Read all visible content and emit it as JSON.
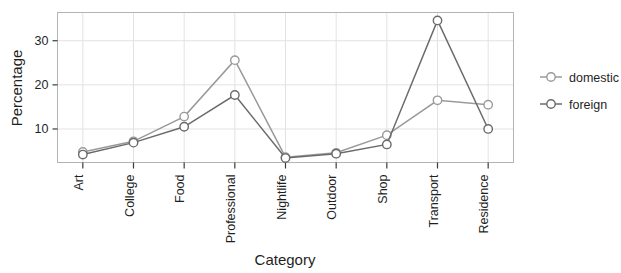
{
  "chart_data": {
    "type": "line",
    "title": "",
    "xlabel": "Category",
    "ylabel": "Percentage",
    "categories": [
      "Art",
      "College",
      "Food",
      "Professional",
      "Nightlife",
      "Outdoor",
      "Shop",
      "Transport",
      "Residence"
    ],
    "series": [
      {
        "name": "domestic",
        "color": "#9a9a9a",
        "marker": "circle-open",
        "values": [
          4.8,
          7.2,
          12.8,
          25.6,
          3.6,
          4.6,
          8.6,
          16.5,
          15.5
        ]
      },
      {
        "name": "foreign",
        "color": "#6b6b6b",
        "marker": "circle-open",
        "values": [
          4.2,
          6.9,
          10.5,
          17.7,
          3.4,
          4.4,
          6.5,
          34.6,
          10.0
        ]
      }
    ],
    "ylim": [
      2.4,
      36.4
    ],
    "yticks": [
      10,
      20,
      30
    ],
    "ytick_labels": [
      "10",
      "20",
      "30"
    ],
    "grid": true,
    "grid_color": "#e2e2e2",
    "legend_position": "right",
    "panel_border_color": "#b4b4b4",
    "background": "#ffffff"
  },
  "legend": {
    "entries": [
      {
        "label": "domestic"
      },
      {
        "label": "foreign"
      }
    ]
  }
}
